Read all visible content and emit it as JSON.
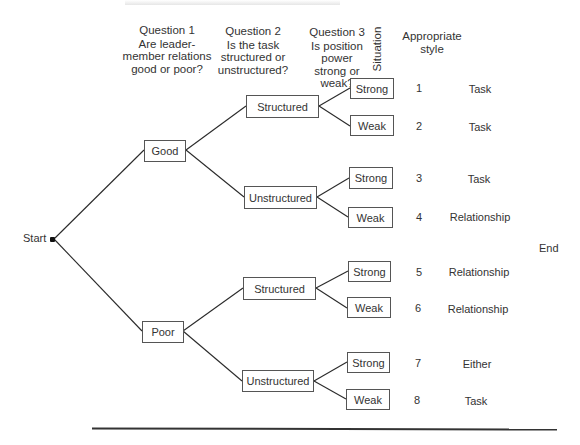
{
  "title_fragment": "...ONTINGENCY MODEL",
  "headers": {
    "q1": {
      "label": "Question 1",
      "text": "Are leader-member relations good or poor?"
    },
    "q1_lines": [
      "Are leader-",
      "member relations",
      "good or poor?"
    ],
    "q2": {
      "label": "Question 2"
    },
    "q2_lines": [
      "Is the task",
      "structured or",
      "unstructured?"
    ],
    "q3": {
      "label": "Question 3"
    },
    "q3_lines": [
      "Is position power",
      "strong or weak?"
    ],
    "situation": "Situation",
    "style_lines": [
      "Appropriate",
      "style"
    ]
  },
  "start_label": "Start",
  "end_label": "End",
  "tree": {
    "level1": [
      {
        "label": "Good"
      },
      {
        "label": "Poor"
      }
    ],
    "level2": [
      {
        "label": "Structured",
        "parent": "Good"
      },
      {
        "label": "Unstructured",
        "parent": "Good"
      },
      {
        "label": "Structured",
        "parent": "Poor"
      },
      {
        "label": "Unstructured",
        "parent": "Poor"
      }
    ],
    "level3": [
      {
        "label": "Strong"
      },
      {
        "label": "Weak"
      },
      {
        "label": "Strong"
      },
      {
        "label": "Weak"
      },
      {
        "label": "Strong"
      },
      {
        "label": "Weak"
      },
      {
        "label": "Strong"
      },
      {
        "label": "Weak"
      }
    ]
  },
  "situations": [
    {
      "num": "1",
      "style": "Task"
    },
    {
      "num": "2",
      "style": "Task"
    },
    {
      "num": "3",
      "style": "Task"
    },
    {
      "num": "4",
      "style": "Relationship"
    },
    {
      "num": "5",
      "style": "Relationship"
    },
    {
      "num": "6",
      "style": "Relationship"
    },
    {
      "num": "7",
      "style": "Either"
    },
    {
      "num": "8",
      "style": "Task"
    }
  ],
  "colors": {
    "line": "#2a2a2a",
    "box_border": "#555555",
    "text": "#333333"
  }
}
